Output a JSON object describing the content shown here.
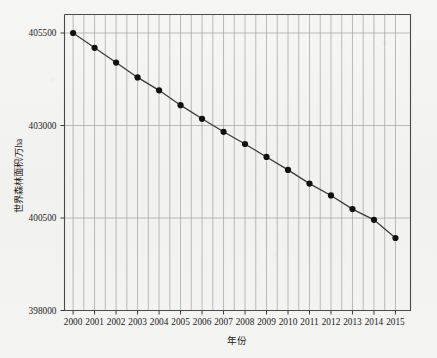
{
  "chart_data": {
    "type": "line",
    "title": "",
    "xlabel": "年份",
    "ylabel": "世界森林面积/万ha",
    "categories": [
      "2000",
      "2001",
      "2002",
      "2003",
      "2004",
      "2005",
      "2006",
      "2007",
      "2008",
      "2009",
      "2010",
      "2011",
      "2012",
      "2013",
      "2014",
      "2015"
    ],
    "x": [
      2000,
      2001,
      2002,
      2003,
      2004,
      2005,
      2006,
      2007,
      2008,
      2009,
      2010,
      2011,
      2012,
      2013,
      2014,
      2015
    ],
    "values": [
      405500,
      405100,
      404700,
      404300,
      403950,
      403550,
      403180,
      402830,
      402500,
      402150,
      401800,
      401430,
      401110,
      400740,
      400450,
      399960
    ],
    "xlim": [
      1999.6,
      2015.7
    ],
    "ylim": [
      398000,
      406000
    ],
    "ytick_labels": [
      "398000",
      "400500",
      "403000",
      "405500"
    ],
    "yticks": [
      398000,
      400500,
      403000,
      405500
    ],
    "grid": "vertical-and-horizontal",
    "legend": "none",
    "marker": "filled-circle",
    "line_color": "#3a3a3a",
    "marker_color": "#111111",
    "grid_color": "#9a9a9a",
    "background_color": "#f4f4f2"
  }
}
